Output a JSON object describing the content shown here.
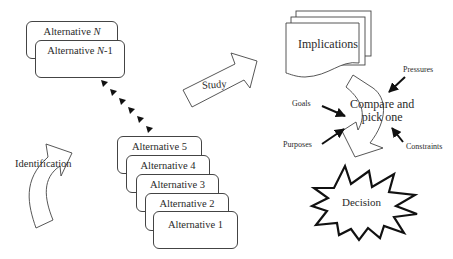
{
  "diagram": {
    "alternatives_top": [
      {
        "label": "Alternative",
        "suffix": "N",
        "suffix_italic": true,
        "extra": ""
      },
      {
        "label": "Alternative",
        "suffix": "N",
        "suffix_italic": true,
        "extra": "-1"
      }
    ],
    "alternatives_stack": [
      {
        "label": "Alternative 5"
      },
      {
        "label": "Alternative 4"
      },
      {
        "label": "Alternative 3"
      },
      {
        "label": "Alternative 2"
      },
      {
        "label": "Alternative 1"
      }
    ],
    "arrows": {
      "identification": "Identification",
      "study": "Study",
      "compare": "Compare and pick one"
    },
    "compare_lines": [
      "Compare and",
      "pick one"
    ],
    "implications": "Implications",
    "inputs": {
      "goals": "Goals",
      "purposes": "Purposes",
      "pressures": "Pressures",
      "constraints": "Constraints"
    },
    "decision": "Decision",
    "colors": {
      "stroke": "#444444",
      "fill": "#ffffff",
      "arrow_fill": "#111111"
    }
  }
}
